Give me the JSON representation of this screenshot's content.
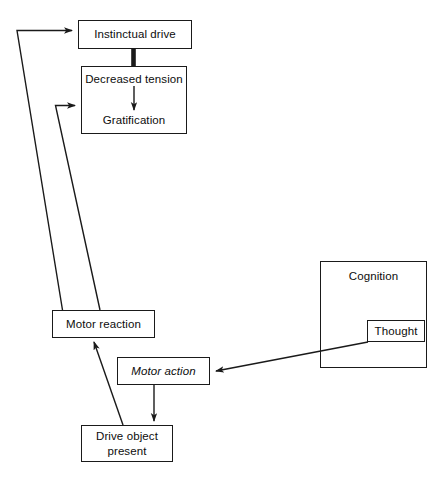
{
  "diagram": {
    "type": "flowchart",
    "background_color": "#ffffff",
    "line_color": "#1a1a1a",
    "text_color": "#0d0d0d",
    "nodes": {
      "instinctual_drive": {
        "label": "Instinctual drive",
        "style": "normal"
      },
      "decreased_tension": {
        "label": "Decreased tension",
        "style": "normal"
      },
      "gratification": {
        "label": "Gratification",
        "style": "normal"
      },
      "motor_reaction": {
        "label": "Motor reaction",
        "style": "normal"
      },
      "motor_action": {
        "label": "Motor action",
        "style": "italic"
      },
      "drive_object_present": {
        "label": "Drive object\npresent",
        "line1": "Drive object",
        "line2": "present",
        "style": "normal"
      },
      "cognition": {
        "label": "Cognition",
        "style": "normal"
      },
      "thought": {
        "label": "Thought",
        "style": "normal"
      }
    },
    "edges": [
      {
        "from": "motor_reaction",
        "to": "instinctual_drive",
        "kind": "elbow-arrow",
        "arrow": "right"
      },
      {
        "from": "motor_reaction",
        "to": "decreased_tension",
        "kind": "elbow-arrow",
        "arrow": "right"
      },
      {
        "from": "instinctual_drive",
        "to": "decreased_tension",
        "kind": "thick-bar",
        "arrow": "none"
      },
      {
        "from": "decreased_tension",
        "to": "gratification",
        "kind": "straight-arrow",
        "arrow": "down"
      },
      {
        "from": "drive_object_present",
        "to": "motor_reaction",
        "kind": "diagonal-arrow",
        "arrow": "up-left"
      },
      {
        "from": "motor_action",
        "to": "drive_object_present",
        "kind": "straight-arrow",
        "arrow": "down"
      },
      {
        "from": "thought",
        "to": "motor_action",
        "kind": "diagonal-arrow",
        "arrow": "left"
      }
    ]
  }
}
